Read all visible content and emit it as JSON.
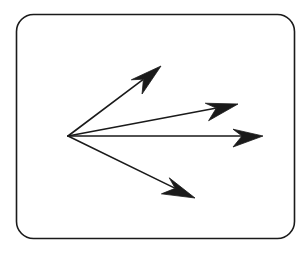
{
  "figure": {
    "kind": "line-drawing",
    "canvas": {
      "width": 307,
      "height": 255,
      "background": "#ffffff"
    },
    "stroke_color": "#1a1a1a",
    "frame": {
      "name": "rounded-rectangle-border",
      "x": 16.5,
      "y": 14.5,
      "width": 278,
      "height": 224,
      "corner_radius": 17,
      "stroke_width": 1.6,
      "fill": "none"
    },
    "origin": {
      "x": 68,
      "y": 136
    },
    "arrows": [
      {
        "id": "arrow-up-steep",
        "label": "upper arrow",
        "from": {
          "x": 68,
          "y": 136
        },
        "to": {
          "x": 161,
          "y": 66
        },
        "shaft_width": 1.6,
        "head_length": 32,
        "head_half_width": 11,
        "head_notch": 10
      },
      {
        "id": "arrow-up-shallow",
        "label": "upper-middle arrow",
        "from": {
          "x": 68,
          "y": 136
        },
        "to": {
          "x": 238,
          "y": 104
        },
        "shaft_width": 1.6,
        "head_length": 32,
        "head_half_width": 11,
        "head_notch": 10
      },
      {
        "id": "arrow-horizontal",
        "label": "horizontal arrow",
        "from": {
          "x": 68,
          "y": 136
        },
        "to": {
          "x": 263,
          "y": 136
        },
        "shaft_width": 1.6,
        "head_length": 30,
        "head_half_width": 11,
        "head_notch": 9
      },
      {
        "id": "arrow-down",
        "label": "lower arrow",
        "from": {
          "x": 68,
          "y": 136
        },
        "to": {
          "x": 195,
          "y": 198
        },
        "shaft_width": 1.6,
        "head_length": 32,
        "head_half_width": 11,
        "head_notch": 10
      }
    ]
  }
}
